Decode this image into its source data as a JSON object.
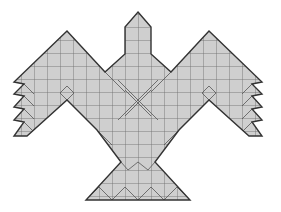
{
  "figure": {
    "colors": {
      "fill": "#cfcfcf",
      "outline": "#333333",
      "grid": "#555555",
      "background": "#ffffff"
    },
    "grid_spacing_px": 13
  }
}
